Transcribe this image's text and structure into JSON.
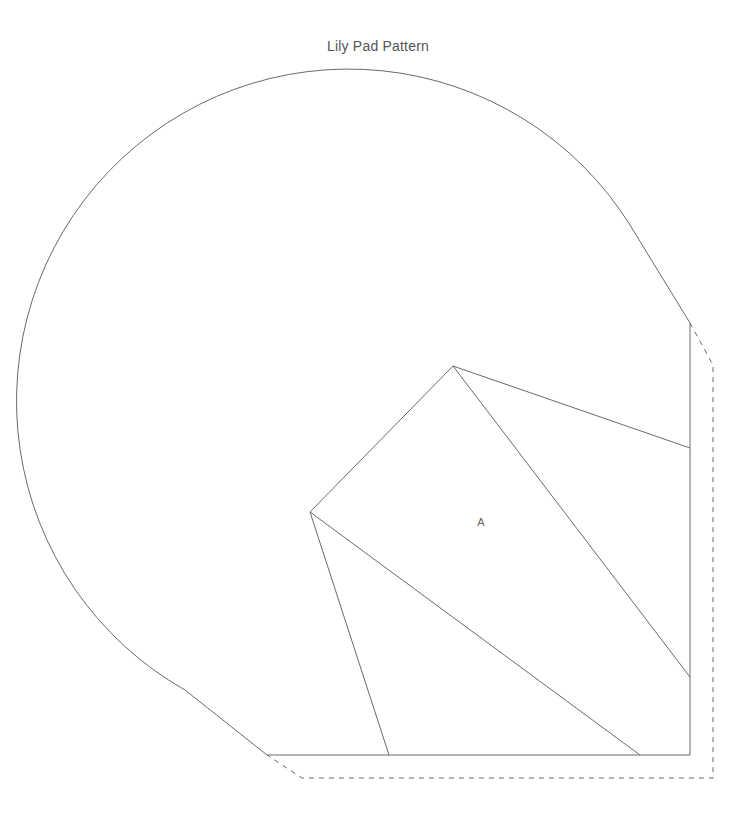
{
  "title": "Lily Pad Pattern",
  "pattern": {
    "piece_label": "A",
    "piece_label_pos": [
      481,
      526
    ],
    "colors": {
      "line": "#6a6a6a",
      "text": "#555555",
      "background": "#ffffff"
    },
    "outline_path": "M 267 755 L 185 690 A 332 332 0 1 1 630 225 L 690 323 L 690 755 Z",
    "seam_allowance_path": "M 690 323 L 713 365 L 713 778 L 302 778 L 267 755",
    "inner_lines": [
      {
        "name": "square-top-left-edge",
        "x1": 453,
        "y1": 366,
        "x2": 310,
        "y2": 512
      },
      {
        "name": "square-top-right-edge",
        "x1": 453,
        "y1": 366,
        "x2": 690,
        "y2": 448
      },
      {
        "name": "square-diagonal-right",
        "x1": 453,
        "y1": 366,
        "x2": 690,
        "y2": 677
      },
      {
        "name": "square-diagonal-bottom",
        "x1": 310,
        "y1": 512,
        "x2": 640,
        "y2": 755
      },
      {
        "name": "square-left-leg",
        "x1": 310,
        "y1": 512,
        "x2": 389,
        "y2": 755
      }
    ]
  }
}
